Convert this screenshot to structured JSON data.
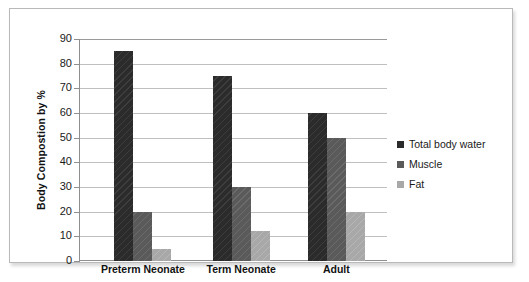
{
  "chart_data": {
    "type": "bar",
    "title": "",
    "xlabel": "",
    "ylabel": "Body Compostion by %",
    "ylim": [
      0,
      90
    ],
    "ytick_labels": [
      "90",
      "80",
      "70",
      "60",
      "50",
      "40",
      "30",
      "20",
      "10",
      "0"
    ],
    "ytick_values": [
      90,
      80,
      70,
      60,
      50,
      40,
      30,
      20,
      10,
      0
    ],
    "grid": true,
    "legend_position": "right",
    "categories": [
      "Preterm Neonate",
      "Term Neonate",
      "Adult"
    ],
    "series": [
      {
        "name": "Total body water",
        "color": "#2b2b2b",
        "values": [
          85,
          75,
          60
        ]
      },
      {
        "name": "Muscle",
        "color": "#5a5a5a",
        "values": [
          20,
          30,
          50
        ]
      },
      {
        "name": "Fat",
        "color": "#a8a8a8",
        "values": [
          5,
          12,
          20
        ]
      }
    ]
  },
  "figure": {
    "background_color": "#ffffff",
    "border_color": "#b9b9b9",
    "gridline_color": "#bfbfbf",
    "axis_color": "#8f8f8f"
  }
}
